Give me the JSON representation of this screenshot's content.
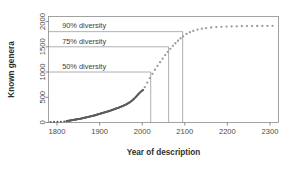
{
  "chart_data": {
    "type": "scatter",
    "title": "",
    "xlabel": "Year of description",
    "ylabel": "Known genera",
    "xlim": [
      1780,
      2320
    ],
    "ylim": [
      0,
      2100
    ],
    "xticks": [
      1800,
      1900,
      2000,
      2100,
      2200,
      2300
    ],
    "xtick_labels": [
      "1800",
      "1900",
      "2000",
      "2100",
      "2200",
      "2300"
    ],
    "yticks": [
      0,
      500,
      1000,
      1500,
      2000
    ],
    "ytick_labels": [
      "0",
      "500",
      "1000",
      "1500",
      "2000"
    ],
    "grid": false,
    "legend": false,
    "series": [
      {
        "name": "Described genera (historical)",
        "style": "dense-dots",
        "color": "#5d5d5d",
        "x": [
          1785,
          1793,
          1801,
          1809,
          1817,
          1822,
          1826,
          1830,
          1834,
          1838,
          1842,
          1846,
          1850,
          1854,
          1858,
          1862,
          1866,
          1870,
          1874,
          1878,
          1882,
          1886,
          1890,
          1894,
          1898,
          1902,
          1906,
          1910,
          1914,
          1918,
          1922,
          1926,
          1930,
          1934,
          1938,
          1942,
          1946,
          1950,
          1954,
          1958,
          1962,
          1966,
          1970,
          1974,
          1978,
          1982,
          1986,
          1990,
          1994,
          1998,
          2002
        ],
        "y": [
          10,
          12,
          14,
          16,
          20,
          26,
          32,
          38,
          44,
          50,
          56,
          62,
          68,
          74,
          80,
          88,
          96,
          104,
          112,
          120,
          128,
          136,
          146,
          156,
          166,
          176,
          186,
          196,
          206,
          216,
          226,
          238,
          250,
          262,
          274,
          286,
          298,
          312,
          326,
          342,
          358,
          376,
          396,
          420,
          448,
          480,
          515,
          552,
          590,
          620,
          645
        ]
      },
      {
        "name": "Projected genera",
        "style": "sparse-dots",
        "color": "#9a9a9a",
        "x": [
          2006,
          2012,
          2018,
          2024,
          2030,
          2036,
          2042,
          2048,
          2054,
          2060,
          2066,
          2072,
          2078,
          2084,
          2090,
          2096,
          2104,
          2112,
          2120,
          2130,
          2140,
          2150,
          2162,
          2174,
          2186,
          2198,
          2210,
          2222,
          2234,
          2246,
          2258,
          2270,
          2282,
          2294,
          2306
        ],
        "y": [
          700,
          790,
          880,
          965,
          1045,
          1120,
          1195,
          1265,
          1335,
          1400,
          1460,
          1520,
          1570,
          1620,
          1665,
          1705,
          1755,
          1790,
          1815,
          1840,
          1858,
          1870,
          1882,
          1890,
          1896,
          1900,
          1903,
          1906,
          1908,
          1910,
          1911,
          1912,
          1913,
          1914,
          1915
        ]
      }
    ],
    "annotations": [
      {
        "id": "diversity-50",
        "label": "50% diversity",
        "y_value": 1000,
        "x_value": 2020,
        "label_x": 1812
      },
      {
        "id": "diversity-75",
        "label": "75% diversity",
        "y_value": 1500,
        "x_value": 2062,
        "label_x": 1812
      },
      {
        "id": "diversity-90",
        "label": "90% diversity",
        "y_value": 1800,
        "x_value": 2095,
        "label_x": 1812
      }
    ],
    "colors": {
      "historical": "#5d5d5d",
      "projected": "#9a9a9a",
      "frame": "#8c8c8c",
      "text": "#3a3a3a",
      "background": "#ffffff"
    }
  }
}
